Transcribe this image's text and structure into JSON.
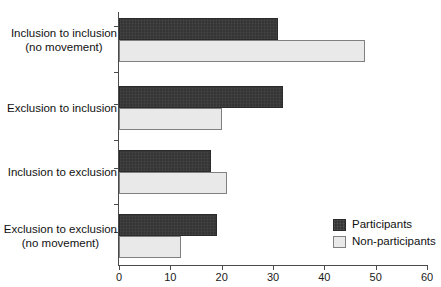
{
  "chart_data": {
    "type": "bar",
    "orientation": "horizontal",
    "title": "",
    "xlabel": "",
    "ylabel": "",
    "xlim": [
      0,
      60
    ],
    "xticks": [
      0,
      10,
      20,
      30,
      40,
      50,
      60
    ],
    "xtick_labels": [
      "0",
      "10",
      "20",
      "30",
      "40",
      "50",
      "60"
    ],
    "grid": false,
    "legend_position": "bottom-right",
    "categories": [
      "Inclusion to inclusion\n(no movement)",
      "Exclusion to inclusion",
      "Inclusion to exclusion",
      "Exclusion to exclusion\n(no movement)"
    ],
    "series": [
      {
        "name": "Participants",
        "color": "#353535",
        "values": [
          31,
          32,
          18,
          19
        ]
      },
      {
        "name": "Non-participants",
        "color": "#e9e9e9",
        "values": [
          48,
          20,
          21,
          12
        ]
      }
    ]
  },
  "legend": {
    "items": [
      {
        "label": "Participants",
        "swatch": "participants"
      },
      {
        "label": "Non-participants",
        "swatch": "nonparticipants"
      }
    ]
  },
  "axis": {
    "line_color": "#4a4a4a"
  }
}
